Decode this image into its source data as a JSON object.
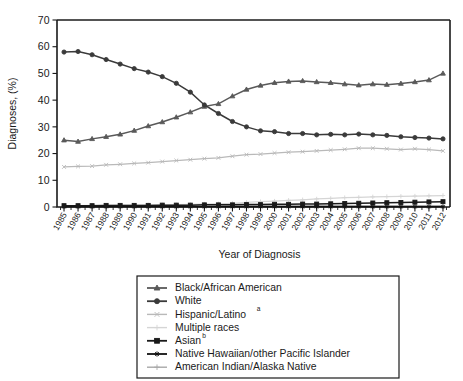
{
  "chart_data": {
    "type": "line",
    "title": "",
    "xlabel": "Year of Diagnosis",
    "ylabel": "Diagnoses, (%)",
    "ylim": [
      0,
      70
    ],
    "yticks": [
      0,
      10,
      20,
      30,
      40,
      50,
      60,
      70
    ],
    "grid": false,
    "legend_position": "below-center",
    "x": [
      1985,
      1986,
      1987,
      1988,
      1989,
      1990,
      1991,
      1992,
      1993,
      1994,
      1995,
      1996,
      1997,
      1998,
      1999,
      2000,
      2001,
      2002,
      2003,
      2004,
      2005,
      2006,
      2007,
      2008,
      2009,
      2010,
      2011,
      2012
    ],
    "categories": [
      "1985",
      "1986",
      "1987",
      "1988",
      "1989",
      "1990",
      "1991",
      "1992",
      "1993",
      "1994",
      "1995",
      "1996",
      "1997",
      "1998",
      "1999",
      "2000",
      "2001",
      "2002",
      "2003",
      "2004",
      "2005",
      "2006",
      "2007",
      "2008",
      "2009",
      "2010",
      "2011",
      "2012"
    ],
    "series": [
      {
        "name": "Black/African American",
        "color": "#595959",
        "marker": "triangle",
        "values": [
          25.0,
          24.5,
          25.5,
          26.3,
          27.2,
          28.6,
          30.3,
          31.8,
          33.6,
          35.5,
          37.6,
          38.6,
          41.5,
          44.0,
          45.5,
          46.5,
          47.0,
          47.2,
          46.8,
          46.5,
          46.0,
          45.6,
          46.0,
          45.8,
          46.2,
          46.8,
          47.5,
          50.0
        ]
      },
      {
        "name": "White",
        "color": "#3a3a3a",
        "marker": "circle",
        "values": [
          58.0,
          58.2,
          57.0,
          55.2,
          53.5,
          51.8,
          50.5,
          48.8,
          46.3,
          43.0,
          38.2,
          35.0,
          32.0,
          30.0,
          28.5,
          28.2,
          27.5,
          27.5,
          27.0,
          27.2,
          27.0,
          27.3,
          27.0,
          26.8,
          26.3,
          26.0,
          25.8,
          25.5
        ]
      },
      {
        "name": "Hispanic/Latino",
        "superscript": "a",
        "color": "#b9b9b9",
        "marker": "x",
        "values": [
          15.0,
          15.2,
          15.3,
          15.8,
          16.0,
          16.3,
          16.6,
          17.0,
          17.4,
          17.7,
          18.1,
          18.4,
          19.0,
          19.6,
          19.8,
          20.2,
          20.5,
          20.7,
          21.0,
          21.3,
          21.6,
          22.0,
          22.0,
          21.8,
          21.5,
          21.8,
          21.5,
          21.0
        ]
      },
      {
        "name": "Multiple races",
        "color": "#d5d5d5",
        "marker": "plus",
        "values": [
          0.5,
          0.5,
          0.6,
          0.6,
          0.7,
          0.7,
          0.8,
          0.8,
          0.9,
          1.0,
          1.1,
          1.2,
          1.4,
          1.7,
          2.0,
          2.2,
          2.5,
          2.7,
          3.0,
          3.2,
          3.5,
          3.6,
          3.8,
          3.9,
          4.0,
          4.1,
          4.2,
          4.3
        ]
      },
      {
        "name": "Asian",
        "superscript": "b",
        "color": "#1a1a1a",
        "marker": "square",
        "values": [
          0.5,
          0.5,
          0.5,
          0.6,
          0.6,
          0.6,
          0.6,
          0.7,
          0.7,
          0.7,
          0.8,
          0.8,
          0.8,
          0.9,
          0.9,
          1.0,
          1.0,
          1.1,
          1.1,
          1.2,
          1.3,
          1.4,
          1.5,
          1.6,
          1.7,
          1.8,
          1.9,
          2.0
        ]
      },
      {
        "name": "Native Hawaiian/other Pacific Islander",
        "color": "#111111",
        "marker": "star",
        "values": [
          0.1,
          0.1,
          0.1,
          0.1,
          0.1,
          0.1,
          0.1,
          0.1,
          0.1,
          0.1,
          0.1,
          0.1,
          0.1,
          0.1,
          0.1,
          0.1,
          0.1,
          0.1,
          0.1,
          0.1,
          0.1,
          0.1,
          0.1,
          0.1,
          0.1,
          0.1,
          0.1,
          0.1
        ]
      },
      {
        "name": "American Indian/Alaska Native",
        "color": "#a8a8a8",
        "marker": "plus",
        "values": [
          0.3,
          0.3,
          0.3,
          0.3,
          0.3,
          0.3,
          0.4,
          0.4,
          0.4,
          0.4,
          0.4,
          0.4,
          0.5,
          0.5,
          0.5,
          0.5,
          0.5,
          0.5,
          0.5,
          0.5,
          0.5,
          0.5,
          0.5,
          0.5,
          0.5,
          0.5,
          0.5,
          0.5
        ]
      }
    ]
  }
}
